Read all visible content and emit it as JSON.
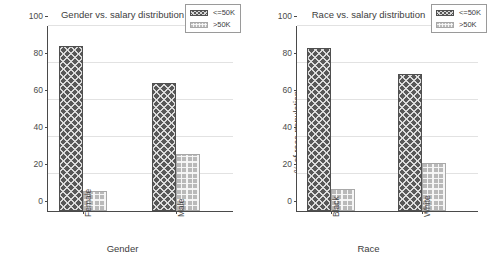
{
  "top_clipped_text": "·····",
  "colors": {
    "bar_low": "#585858",
    "bar_high": "#b9b9b9",
    "axis": "#4a4a4a",
    "grid": "#e2e2e2",
    "text": "#3d3d3d",
    "background": "#ffffff"
  },
  "charts": [
    {
      "id": "gender-chart",
      "chart_data": {
        "type": "bar",
        "title": "Gender vs. salary distribution",
        "xlabel": "Gender",
        "ylabel": "% of gender population",
        "categories": [
          "Female",
          "Male"
        ],
        "series": [
          {
            "name": "<=50K",
            "values": [
              89,
              69
            ]
          },
          {
            "name": ">50K",
            "values": [
              11,
              31
            ]
          }
        ],
        "ylim": [
          0,
          100
        ],
        "yticks": [
          0,
          20,
          40,
          60,
          80,
          100
        ],
        "ytick_labels": [
          "0",
          "20",
          "40",
          "60",
          "80",
          "100"
        ],
        "grid": true,
        "legend_position": "upper right",
        "legend_entries": [
          "<=50K",
          ">50K"
        ],
        "xtick_rotation": 90
      }
    },
    {
      "id": "race-chart",
      "chart_data": {
        "type": "bar",
        "title": "Race vs. salary distribution",
        "xlabel": "Race",
        "ylabel": "% of race population",
        "categories": [
          "Black",
          "White"
        ],
        "series": [
          {
            "name": "<=50K",
            "values": [
              88,
              74
            ]
          },
          {
            "name": ">50K",
            "values": [
              12,
              26
            ]
          }
        ],
        "ylim": [
          0,
          100
        ],
        "yticks": [
          0,
          20,
          40,
          60,
          80,
          100
        ],
        "ytick_labels": [
          "0",
          "20",
          "40",
          "60",
          "80",
          "100"
        ],
        "grid": true,
        "legend_position": "upper right",
        "legend_entries": [
          "<=50K",
          ">50K"
        ],
        "xtick_rotation": 90
      }
    }
  ]
}
